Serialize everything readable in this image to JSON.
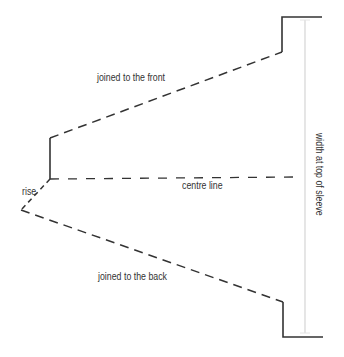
{
  "diagram": {
    "type": "sleeve pattern piece",
    "labels": {
      "front": "joined to the front",
      "back": "joined to the back",
      "centre": "centre line",
      "rise": "rise",
      "width": "width at top of sleeve"
    },
    "colors": {
      "line": "#333333",
      "measure": "#d8d8d8",
      "text": "#333333"
    }
  }
}
